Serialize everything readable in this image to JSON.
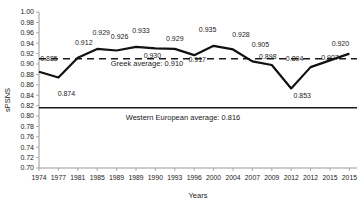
{
  "chart_data": {
    "type": "line",
    "title": "",
    "xlabel": "Years",
    "ylabel": "sPSNS",
    "ylim": [
      0.7,
      1.0
    ],
    "ytick_step": 0.02,
    "grid": false,
    "legend": "none",
    "categories": [
      "1974",
      "1977",
      "1981",
      "1985",
      "1989",
      "1989",
      "1990",
      "1993",
      "1996",
      "2000",
      "2004",
      "2007",
      "2009",
      "2012",
      "2012",
      "2015",
      "2015"
    ],
    "series": [
      {
        "name": "Greece sPSNS",
        "values": [
          0.885,
          0.874,
          0.912,
          0.929,
          0.926,
          0.933,
          0.93,
          0.929,
          0.917,
          0.935,
          0.928,
          0.905,
          0.898,
          0.853,
          0.894,
          0.907,
          0.92
        ]
      }
    ],
    "point_labels": [
      {
        "text": "0.885",
        "dx": 10,
        "dy": -13
      },
      {
        "text": "0.874",
        "dx": 8,
        "dy": 16
      },
      {
        "text": "0.912",
        "dx": 6,
        "dy": -15
      },
      {
        "text": "0.929",
        "dx": 4,
        "dy": -16
      },
      {
        "text": "0.926",
        "dx": 3,
        "dy": -14
      },
      {
        "text": "0.933",
        "dx": 5,
        "dy": -16
      },
      {
        "text": "0.930",
        "dx": -3,
        "dy": 7
      },
      {
        "text": "0.929",
        "dx": 0,
        "dy": -10
      },
      {
        "text": "0.917",
        "dx": 3,
        "dy": 4
      },
      {
        "text": "0.935",
        "dx": -6,
        "dy": -16
      },
      {
        "text": "0.928",
        "dx": 8,
        "dy": -15
      },
      {
        "text": "0.905",
        "dx": 8,
        "dy": -17
      },
      {
        "text": "0.898",
        "dx": -4,
        "dy": -8
      },
      {
        "text": "0.853",
        "dx": 11,
        "dy": 7
      },
      {
        "text": "0.894",
        "dx": -16,
        "dy": -9
      },
      {
        "text": "0.907",
        "dx": 0,
        "dy": -3
      },
      {
        "text": "0.920",
        "dx": -9,
        "dy": -10
      }
    ],
    "reference_lines": [
      {
        "label": "Greek average: 0.910",
        "value": 0.91,
        "style": "dashed"
      },
      {
        "label": "Western European average: 0.816",
        "value": 0.816,
        "style": "solid"
      }
    ],
    "colors": {
      "line": "#111111",
      "axis": "#9a9a9a",
      "text": "#1a1a1a"
    }
  }
}
